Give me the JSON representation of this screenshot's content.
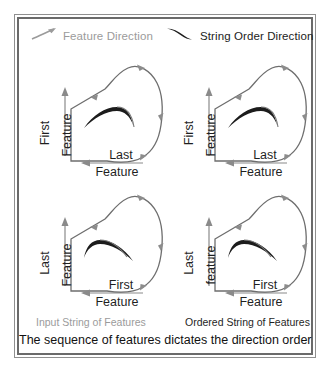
{
  "figure": {
    "border_color": "#6a6a6a",
    "background": "#ffffff"
  },
  "legend": {
    "feature": {
      "icon": "straight-gray-arrow-icon",
      "label": "Feature Direction",
      "color": "#9b9b9b"
    },
    "string": {
      "icon": "dark-tapered-curved-arrow-icon",
      "label": "String Order  Direction",
      "color": "#1c1c1c"
    }
  },
  "panels": [
    {
      "id": "top-left",
      "vertical_axis": {
        "primary": "First",
        "secondary": "Feature"
      },
      "horizontal_axis": {
        "primary": "Last",
        "secondary": "Feature"
      },
      "inner_arrow_direction": "right",
      "outline_arrow_flow": "counter-clockwise"
    },
    {
      "id": "top-right",
      "vertical_axis": {
        "primary": "First",
        "secondary": "Feature"
      },
      "horizontal_axis": {
        "primary": "Last",
        "secondary": "Feature"
      },
      "inner_arrow_direction": "right",
      "outline_arrow_flow": "clockwise"
    },
    {
      "id": "bottom-left",
      "vertical_axis": {
        "primary": "Last",
        "secondary": "Feature"
      },
      "horizontal_axis": {
        "primary": "First",
        "secondary": "Feature"
      },
      "inner_arrow_direction": "left",
      "outline_arrow_flow": "counter-clockwise"
    },
    {
      "id": "bottom-right",
      "vertical_axis": {
        "primary": "Last",
        "secondary": "feature"
      },
      "horizontal_axis": {
        "primary": "First",
        "secondary": "Feature"
      },
      "inner_arrow_direction": "left",
      "outline_arrow_flow": "clockwise"
    }
  ],
  "captions": {
    "left": "Input String of Features",
    "right": "Ordered String of Features",
    "bottom": "The sequence of features dictates the direction order"
  },
  "colors": {
    "gray_arrow": "#8c8c8c",
    "dark_arrow": "#1c1c1c",
    "outline": "#6e6e6e",
    "axis": "#8a8a8a",
    "text_dark": "#1f1f1f",
    "text_gray": "#9b9b9b"
  }
}
